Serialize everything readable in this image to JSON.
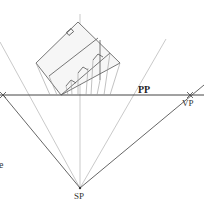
{
  "diagram": {
    "type": "two-point perspective plan construction",
    "labels": {
      "picture_plane": "PP",
      "vanishing_point": "VP",
      "station_point": "SP",
      "partial_text": "e"
    },
    "colors": {
      "primary_line": "#555555",
      "construction_line": "#b0b0b0",
      "background": "#ffffff"
    }
  }
}
